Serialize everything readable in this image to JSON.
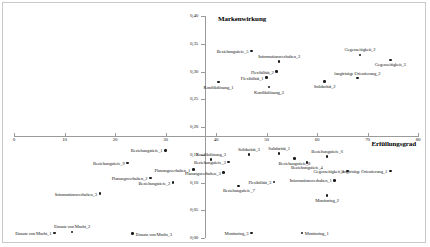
{
  "chart_data": {
    "type": "scatter",
    "title": "",
    "xlabel": "Erfüllungsgrad",
    "ylabel": "Markenwirkung",
    "xlim": [
      0,
      80
    ],
    "ylim": [
      0.0,
      0.4
    ],
    "xticks": [
      "0",
      "10",
      "20",
      "30",
      "40",
      "50",
      "60",
      "70",
      "80"
    ],
    "yticks": [
      "0,40",
      "0,35",
      "0,30",
      "0,25",
      "0,20",
      "0,15",
      "0,10",
      "0,05",
      "0,00"
    ],
    "grid": false,
    "legend": "none",
    "points": [
      {
        "label": "Beziehungstiefe_5",
        "x": 47.0,
        "y": 0.337,
        "lx": 0.52,
        "ly": 0.5,
        "pos": "l"
      },
      {
        "label": "Informationsverhalten_2",
        "x": 52.5,
        "y": 0.318,
        "lx": 0.5,
        "ly": -0.7,
        "pos": "t"
      },
      {
        "label": "Gegenseitigkeit_2",
        "x": 68.5,
        "y": 0.33,
        "lx": 0.5,
        "ly": -0.7,
        "pos": "t"
      },
      {
        "label": "Gegenseitigkeit_3",
        "x": 74.5,
        "y": 0.321,
        "lx": 0.5,
        "ly": 1.6,
        "pos": "b"
      },
      {
        "label": "Flexibilität_2",
        "x": 52.0,
        "y": 0.3,
        "lx": 0.52,
        "ly": 0.5,
        "pos": "l"
      },
      {
        "label": "Flexibilität_1",
        "x": 50.0,
        "y": 0.289,
        "lx": 0.52,
        "ly": 0.5,
        "pos": "l"
      },
      {
        "label": "Konfliktlösung_1",
        "x": 40.5,
        "y": 0.281,
        "lx": 0.5,
        "ly": 1.6,
        "pos": "b"
      },
      {
        "label": "Konfliktlösung_2",
        "x": 50.5,
        "y": 0.272,
        "lx": 0.5,
        "ly": 1.6,
        "pos": "b"
      },
      {
        "label": "Solidarität_2",
        "x": 61.5,
        "y": 0.282,
        "lx": 0.5,
        "ly": 1.6,
        "pos": "b"
      },
      {
        "label": "langfristige Orientierung_2",
        "x": 68.0,
        "y": 0.288,
        "lx": 0.5,
        "ly": -0.7,
        "pos": "t"
      },
      {
        "label": "Beziehungstiefe_1",
        "x": 30.0,
        "y": 0.158,
        "lx": 0.52,
        "ly": 0.5,
        "pos": "l"
      },
      {
        "label": "Beziehungstiefe_9",
        "x": 22.5,
        "y": 0.135,
        "lx": 0.52,
        "ly": 0.5,
        "pos": "l"
      },
      {
        "label": "Konfliktlösung_3",
        "x": 39.0,
        "y": 0.141,
        "lx": 0.5,
        "ly": -0.7,
        "pos": "t"
      },
      {
        "label": "Beziehungstiefe_3",
        "x": 42.5,
        "y": 0.137,
        "lx": 0.52,
        "ly": 0.5,
        "pos": "l"
      },
      {
        "label": "Solidarität_3",
        "x": 46.5,
        "y": 0.15,
        "lx": 0.5,
        "ly": -0.7,
        "pos": "t"
      },
      {
        "label": "Solidarität_1",
        "x": 52.5,
        "y": 0.152,
        "lx": 0.5,
        "ly": -0.7,
        "pos": "t"
      },
      {
        "label": "Beziehungstiefe_8",
        "x": 55.5,
        "y": 0.143,
        "lx": 0.5,
        "ly": 1.6,
        "pos": "b"
      },
      {
        "label": "Beziehungstiefe_4",
        "x": 58.0,
        "y": 0.136,
        "lx": 0.5,
        "ly": 1.6,
        "pos": "b"
      },
      {
        "label": "Beziehungstiefe_6",
        "x": 62.0,
        "y": 0.147,
        "lx": 0.5,
        "ly": -0.7,
        "pos": "t"
      },
      {
        "label": "Gegenseitigkeit_1",
        "x": 66.0,
        "y": 0.121,
        "lx": 0.52,
        "ly": 0.5,
        "pos": "l"
      },
      {
        "label": "langfristige Orientierung_1",
        "x": 74.5,
        "y": 0.121,
        "lx": 0.52,
        "ly": 0.5,
        "pos": "l"
      },
      {
        "label": "Planungsverhalten_1",
        "x": 35.5,
        "y": 0.123,
        "lx": 0.52,
        "ly": 0.5,
        "pos": "l"
      },
      {
        "label": "Planungsverhalten_2",
        "x": 27.0,
        "y": 0.108,
        "lx": 0.52,
        "ly": 0.5,
        "pos": "l"
      },
      {
        "label": "Planungsverhalten_3",
        "x": 41.5,
        "y": 0.118,
        "lx": 0.52,
        "ly": 0.5,
        "pos": "l"
      },
      {
        "label": "Beziehungstiefe_2",
        "x": 31.5,
        "y": 0.1,
        "lx": 0.52,
        "ly": 0.5,
        "pos": "l"
      },
      {
        "label": "Beziehungstiefe_7",
        "x": 44.5,
        "y": 0.094,
        "lx": 0.5,
        "ly": 1.6,
        "pos": "b"
      },
      {
        "label": "Flexibilität_3",
        "x": 51.5,
        "y": 0.101,
        "lx": 0.52,
        "ly": 0.5,
        "pos": "l"
      },
      {
        "label": "Informationsverhalten_1",
        "x": 63.5,
        "y": 0.104,
        "lx": 0.52,
        "ly": 0.5,
        "pos": "l"
      },
      {
        "label": "Informationsverhalten_3",
        "x": 17.0,
        "y": 0.08,
        "lx": 0.52,
        "ly": 0.5,
        "pos": "l"
      },
      {
        "label": "Monitoring_2",
        "x": 62.0,
        "y": 0.077,
        "lx": 0.5,
        "ly": 1.6,
        "pos": "b"
      },
      {
        "label": "Einsatz von Macht_1",
        "x": 8.0,
        "y": 0.009,
        "lx": 0.52,
        "ly": 0.5,
        "pos": "l"
      },
      {
        "label": "Einsatz von Macht_2",
        "x": 11.5,
        "y": 0.011,
        "lx": 0.5,
        "ly": -0.7,
        "pos": "t"
      },
      {
        "label": "Einsatz von Macht_3",
        "x": 23.5,
        "y": 0.008,
        "lx": 0.5,
        "ly": 0.5,
        "pos": "r"
      },
      {
        "label": "Monitoring_3",
        "x": 47.0,
        "y": 0.009,
        "lx": 0.52,
        "ly": 0.5,
        "pos": "l"
      },
      {
        "label": "Monitoring_1",
        "x": 57.0,
        "y": 0.009,
        "lx": 0.5,
        "ly": 0.5,
        "pos": "r"
      }
    ]
  }
}
